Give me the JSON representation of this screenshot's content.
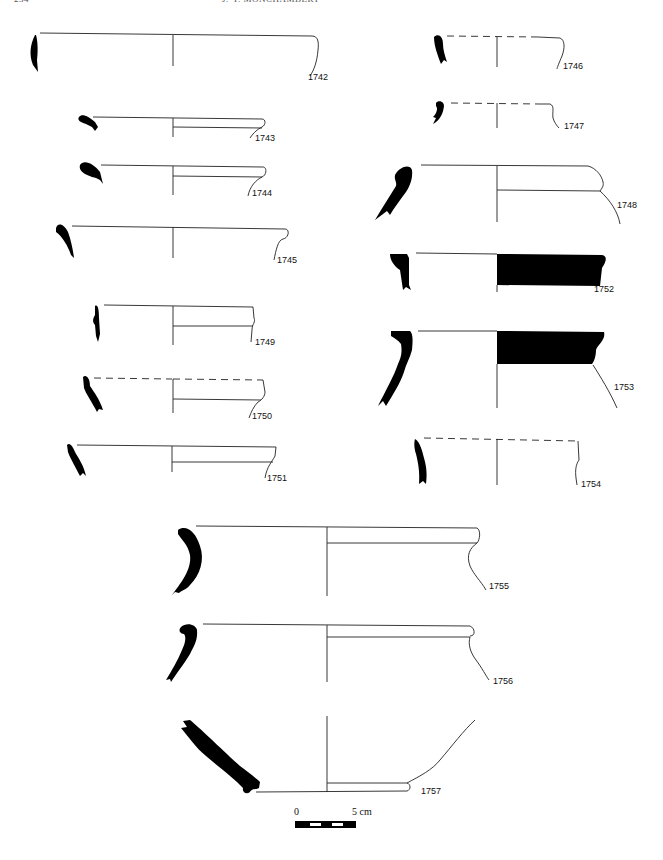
{
  "header": {
    "page_number": "234",
    "author": "J.-Y. MONCHAMBERT"
  },
  "figure": {
    "type": "pottery profile drawings",
    "profiles": [
      {
        "id": "1742",
        "label": "1742",
        "column": "left",
        "rim": "solid"
      },
      {
        "id": "1743",
        "label": "1743",
        "column": "left",
        "rim": "solid"
      },
      {
        "id": "1744",
        "label": "1744",
        "column": "left",
        "rim": "solid"
      },
      {
        "id": "1745",
        "label": "1745",
        "column": "left",
        "rim": "solid"
      },
      {
        "id": "1749",
        "label": "1749",
        "column": "left",
        "rim": "solid"
      },
      {
        "id": "1750",
        "label": "1750",
        "column": "left",
        "rim": "dashed"
      },
      {
        "id": "1751",
        "label": "1751",
        "column": "left",
        "rim": "solid"
      },
      {
        "id": "1746",
        "label": "1746",
        "column": "right",
        "rim": "dashed"
      },
      {
        "id": "1747",
        "label": "1747",
        "column": "right",
        "rim": "dashed"
      },
      {
        "id": "1748",
        "label": "1748",
        "column": "right",
        "rim": "solid"
      },
      {
        "id": "1752",
        "label": "1752",
        "column": "right",
        "rim": "solid",
        "painted_band": true
      },
      {
        "id": "1753",
        "label": "1753",
        "column": "right",
        "rim": "solid",
        "painted_band": true
      },
      {
        "id": "1754",
        "label": "1754",
        "column": "right",
        "rim": "dashed"
      },
      {
        "id": "1755",
        "label": "1755",
        "column": "center",
        "rim": "solid"
      },
      {
        "id": "1756",
        "label": "1756",
        "column": "center",
        "rim": "solid"
      },
      {
        "id": "1757",
        "label": "1757",
        "column": "center",
        "rim": "base"
      }
    ],
    "scale_bar": {
      "start_label": "0",
      "end_label": "5 cm",
      "segments": 5
    }
  }
}
